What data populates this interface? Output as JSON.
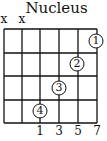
{
  "title": "Nucleus",
  "muted_strings": [
    {
      "string": 1,
      "mark": "x"
    },
    {
      "string": 2,
      "mark": "x"
    }
  ],
  "grid": {
    "strings": 6,
    "frets": 4
  },
  "fingers": [
    {
      "label": "1",
      "string": 6,
      "fret": 1
    },
    {
      "label": "2",
      "string": 5,
      "fret": 2
    },
    {
      "label": "3",
      "string": 4,
      "fret": 3
    },
    {
      "label": "4",
      "string": 3,
      "fret": 4
    }
  ],
  "interval_labels": [
    {
      "string": 3,
      "text": "1"
    },
    {
      "string": 4,
      "text": "3"
    },
    {
      "string": 5,
      "text": "5"
    },
    {
      "string": 6,
      "text": "7"
    }
  ]
}
